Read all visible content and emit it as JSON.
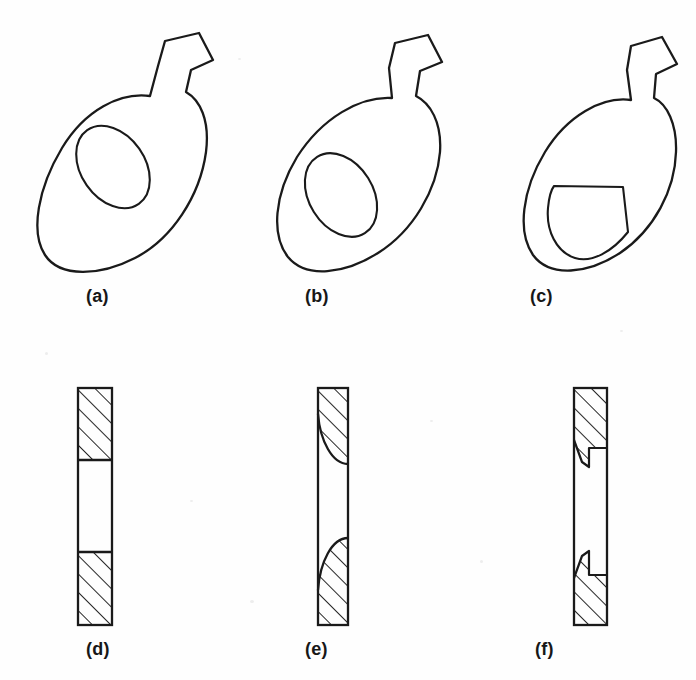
{
  "figure": {
    "kind": "engineering-drawing",
    "background_color": "#fefefe",
    "line_color": "#1a1a1a",
    "hatch_color": "#1a1a1a",
    "panels": [
      {
        "id": "a",
        "label": "(a)",
        "row": "top",
        "view": "plan",
        "outline": "tilted oval plate with rectangular neck tab at upper right",
        "hole": "elliptical through hole, centred",
        "hole_shape": "ellipse"
      },
      {
        "id": "b",
        "label": "(b)",
        "row": "top",
        "view": "plan",
        "outline": "tilted oval plate with rectangular neck tab at upper right",
        "hole": "elliptical through hole, offset toward lower left",
        "hole_shape": "ellipse"
      },
      {
        "id": "c",
        "label": "(c)",
        "row": "top",
        "view": "plan",
        "outline": "tilted oval plate with rectangular neck tab at upper right",
        "hole": "D-shaped through hole with straight top and right edges",
        "hole_shape": "d-shape"
      },
      {
        "id": "d",
        "label": "(d)",
        "row": "bottom",
        "view": "section",
        "profile": "straight square-cut shoulders",
        "hatched_regions": 2,
        "boundary": "flat horizontal"
      },
      {
        "id": "e",
        "label": "(e)",
        "row": "bottom",
        "view": "section",
        "profile": "curved radiused shoulders",
        "hatched_regions": 2,
        "boundary": "concave arc"
      },
      {
        "id": "f",
        "label": "(f)",
        "row": "bottom",
        "view": "section",
        "profile": "stepped counterbored shoulders",
        "hatched_regions": 2,
        "boundary": "stepped notch"
      }
    ],
    "captions": {
      "a": "(a)",
      "b": "(b)",
      "c": "(c)",
      "d": "(d)",
      "e": "(e)",
      "f": "(f)"
    }
  }
}
